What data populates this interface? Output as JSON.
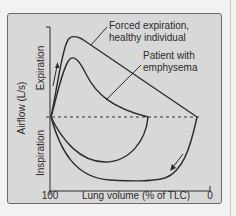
{
  "figure": {
    "y_axis": {
      "title": "Airflow (L/s)",
      "upper_label": "Expiration",
      "lower_label": "Inspiration"
    },
    "x_axis": {
      "title": "Lung volume (% of TLC)",
      "left_tick": "100",
      "right_tick": "0"
    },
    "curves": [
      {
        "name": "healthy",
        "label_line1": "Forced expiration,",
        "label_line2": "healthy individual"
      },
      {
        "name": "emphysema",
        "label_line1": "Patient with",
        "label_line2": "emphysema"
      }
    ],
    "colors": {
      "panel_bg": "#d8d8d8",
      "curve": "#2b2b2b",
      "page_bg": "#f2f2f2"
    }
  }
}
